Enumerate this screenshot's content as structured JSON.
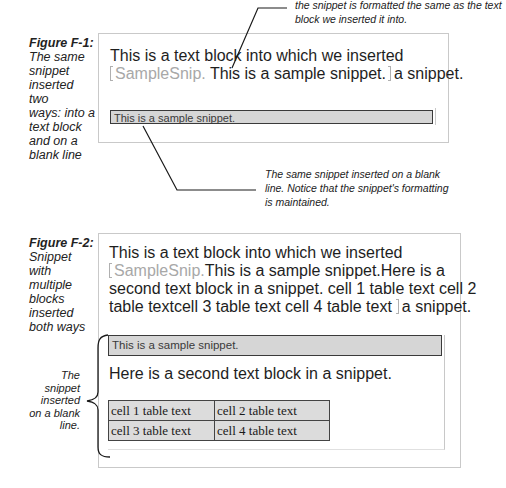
{
  "figure1": {
    "caption_title": "Figure F-1:",
    "caption_lines": [
      "The same",
      "snippet",
      "inserted two",
      "ways: into a",
      "text block",
      "and on a",
      "blank line"
    ],
    "callout_top_lines": [
      "the snippet is formatted the same as the text",
      "block we inserted it into."
    ],
    "text_line1": "This is a text block into which we inserted",
    "snippet_label": "SampleSnip",
    "snippet_inline_text": "This is a sample snippet.",
    "after_snippet": "a snippet.",
    "snippet_bar_text": "This is a sample snippet.",
    "callout_bottom_lines": [
      "The same snippet inserted on a blank",
      "line. Notice that the snippet's formatting",
      "is maintained."
    ]
  },
  "figure2": {
    "caption_title": "Figure F-2:",
    "caption_lines": [
      "Snippet with",
      "multiple",
      "blocks",
      "inserted",
      "both ways"
    ],
    "text_line1": "This is a text block into which we inserted",
    "snippet_label": "SampleSnip",
    "text_line2_rest": "This is a sample snippet.Here is a",
    "text_line3": "second text block in a snippet. cell 1 table text cell 2",
    "text_line4": "table textcell 3 table text cell 4 table text",
    "after_snippet": "a snippet.",
    "side_note_lines": [
      "The",
      "snippet",
      "inserted",
      "on a blank",
      "line."
    ],
    "snippet_bar_text": "This is a sample snippet.",
    "second_block_text": "Here is a second text block in a snippet.",
    "table": {
      "rows": [
        [
          "cell 1 table text",
          "cell 2 table text"
        ],
        [
          "cell 3 table text",
          "cell 4 table text"
        ]
      ]
    }
  }
}
